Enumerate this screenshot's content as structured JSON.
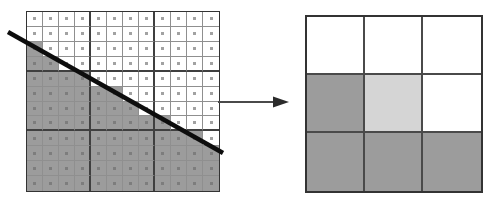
{
  "canvas": {
    "width": 493,
    "height": 202,
    "background": "#ffffff"
  },
  "left_grid": {
    "x": 26,
    "y": 11,
    "width": 194,
    "height": 181,
    "cols": 12,
    "rows": 12,
    "block_size": 4,
    "gray_cells_per_row": [
      0,
      0,
      1,
      2,
      4,
      6,
      7,
      9,
      11,
      12,
      12,
      12
    ],
    "cell_fill_gray": "#9c9c9c",
    "cell_fill_white": "#ffffff",
    "thin_line_color": "#8f8f8f",
    "thick_line_color": "#3f3f3f",
    "border_color": "#333333",
    "dot_color_on_white": "#a2a2a2",
    "dot_color_on_gray": "#7d7d7d",
    "dot_size": 3
  },
  "diagonal_line": {
    "x1": 8,
    "y1": 32,
    "x2": 223,
    "y2": 153,
    "stroke": "#0d0d0d",
    "stroke_width": 4.5
  },
  "arrow": {
    "x1": 218,
    "y1": 102,
    "x2": 273,
    "y2": 102,
    "head_length": 16,
    "head_half_height": 5.5,
    "shaft_color": "#4a4a4a",
    "shaft_width": 2,
    "head_color": "#2b2b2b"
  },
  "right_grid": {
    "x": 305,
    "y": 15,
    "width": 178,
    "height": 178,
    "cols": 3,
    "rows": 3,
    "cells": [
      [
        "white",
        "white",
        "white"
      ],
      [
        "gray",
        "light",
        "white"
      ],
      [
        "gray",
        "gray",
        "gray"
      ]
    ],
    "fills": {
      "white": "#ffffff",
      "light": "#d5d5d5",
      "gray": "#9c9c9c"
    },
    "inner_line_color": "#4a4a4a",
    "border_color": "#333333"
  }
}
